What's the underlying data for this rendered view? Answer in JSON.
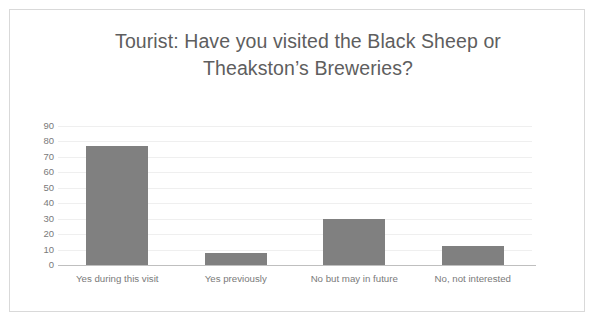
{
  "chart_data": {
    "type": "bar",
    "title_line1": "Tourist: Have you visited the Black Sheep or",
    "title_line2": "Theakston’s Breweries?",
    "categories": [
      "Yes during this visit",
      "Yes previously",
      "No but may in future",
      "No, not interested"
    ],
    "values": [
      77,
      8,
      30,
      12
    ],
    "xlabel": "",
    "ylabel": "",
    "ylim": [
      0,
      90
    ],
    "ytick_step": 10,
    "yticks": [
      90,
      80,
      70,
      60,
      50,
      40,
      30,
      20,
      10,
      0
    ],
    "ytick_labels": [
      "90",
      "80",
      "70",
      "60",
      "50",
      "40",
      "30",
      "20",
      "10",
      "0"
    ],
    "grid": true,
    "grid_axis": "y",
    "legend": false,
    "legend_position": "none",
    "series": [
      {
        "name": "Responses",
        "values": [
          77,
          8,
          30,
          12
        ]
      }
    ]
  },
  "colors": {
    "bar_fill": "#808080",
    "gridline": "#efefef",
    "axis_line": "#bfbfbf",
    "tick_label": "#7a7a7a",
    "title_text": "#5e5e5e",
    "frame_border": "#d9d9d9",
    "background": "#ffffff"
  }
}
